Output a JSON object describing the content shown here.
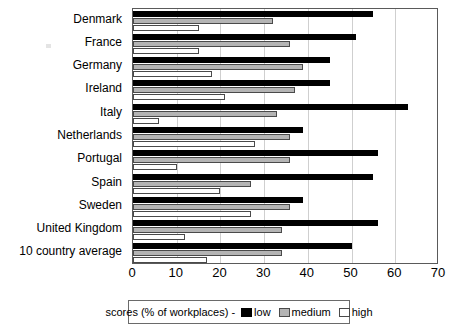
{
  "chart_data": {
    "type": "bar",
    "orientation": "horizontal",
    "title": "",
    "xlabel": "",
    "ylabel": "",
    "xlim": [
      0,
      70
    ],
    "xticks": [
      0,
      10,
      20,
      30,
      40,
      50,
      60,
      70
    ],
    "grid": true,
    "grid_axis": "x",
    "legend_position": "bottom",
    "legend_title": "scores (% of workplaces) -",
    "categories": [
      "Denmark",
      "France",
      "Germany",
      "Ireland",
      "Italy",
      "Netherlands",
      "Portugal",
      "Spain",
      "Sweden",
      "United Kingdom",
      "10 country average"
    ],
    "series": [
      {
        "name": "low",
        "color": "#000000",
        "values": [
          55,
          51,
          45,
          45,
          63,
          39,
          56,
          55,
          39,
          56,
          50
        ]
      },
      {
        "name": "medium",
        "color": "#b4b4b4",
        "values": [
          32,
          36,
          39,
          37,
          33,
          36,
          36,
          27,
          36,
          34,
          34
        ]
      },
      {
        "name": "high",
        "color": "#ffffff",
        "values": [
          15,
          15,
          18,
          21,
          6,
          28,
          10,
          20,
          27,
          12,
          17
        ]
      }
    ]
  },
  "axis": {
    "x_tick_labels": [
      "0",
      "10",
      "20",
      "30",
      "40",
      "50",
      "60",
      "70"
    ]
  },
  "legend": {
    "title": "scores (% of workplaces) -",
    "entries": [
      {
        "label": "low",
        "swatch": "low"
      },
      {
        "label": "medium",
        "swatch": "medium"
      },
      {
        "label": "high",
        "swatch": "high"
      }
    ]
  }
}
